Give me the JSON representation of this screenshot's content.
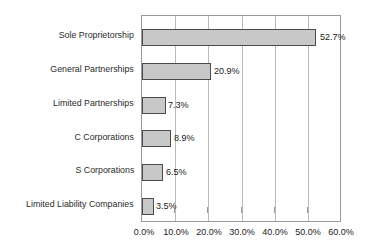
{
  "chart_data": {
    "type": "bar",
    "orientation": "horizontal",
    "title": "",
    "xlabel": "",
    "ylabel": "",
    "categories": [
      "Sole Proprietorship",
      "General Partnerships",
      "Limited Partnerships",
      "C Corporations",
      "S Corporations",
      "Limited Liability Companies"
    ],
    "values": [
      52.7,
      20.9,
      7.3,
      8.9,
      6.5,
      3.5
    ],
    "value_labels": [
      "52.7%",
      "20.9%",
      "7.3%",
      "8.9%",
      "6.5%",
      "3.5%"
    ],
    "xlim": [
      0,
      60
    ],
    "xticks": [
      0,
      10,
      20,
      30,
      40,
      50,
      60
    ],
    "xtick_labels": [
      "0.0%",
      "10.0%",
      "20.0%",
      "30.0%",
      "40.0%",
      "50.0%",
      "60.0%"
    ],
    "grid": true,
    "legend": null,
    "bar_fill_color": "#c8c8c8",
    "bar_border_color": "#4a4a4a",
    "gridline_color": "#b9b9b9",
    "axis_color": "#9a9a9a",
    "text_color": "#1a1a1a"
  }
}
